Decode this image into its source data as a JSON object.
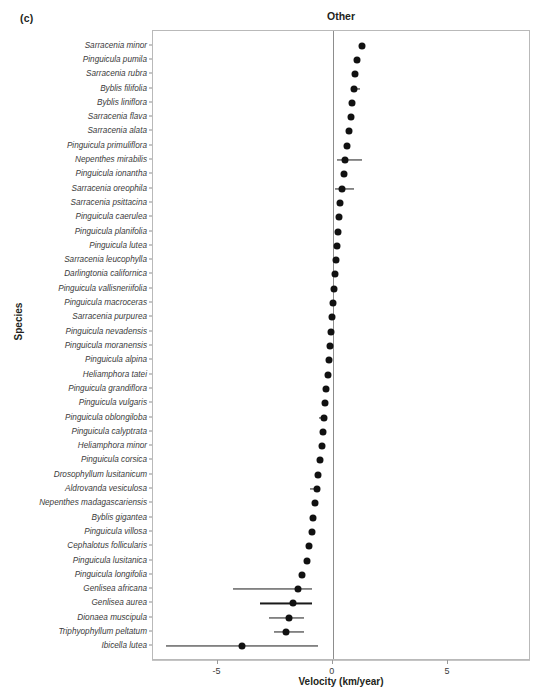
{
  "panel": {
    "label": "(c)"
  },
  "axes": {
    "title": "Other",
    "xlabel": "Velocity (km/year)",
    "ylabel": "Species",
    "xticks": [
      "-5",
      "0",
      "5"
    ]
  },
  "chart_data": {
    "type": "scatter",
    "title": "Other",
    "xlabel": "Velocity (km/year)",
    "ylabel": "Species",
    "xlim": [
      -7.8,
      8.6
    ],
    "xticks": [
      -5,
      0,
      5
    ],
    "grid": false,
    "legend": null,
    "annotations": [
      "(c)"
    ],
    "reference_line_x": 0,
    "orientation": "horizontal",
    "error_bar_type": "confidence-interval",
    "categories": [
      "Sarracenia minor",
      "Pinguicula pumila",
      "Sarracenia rubra",
      "Byblis filifolia",
      "Byblis liniflora",
      "Sarracenia flava",
      "Sarracenia alata",
      "Pinguicula primuliflora",
      "Nepenthes mirabilis",
      "Pinguicula ionantha",
      "Sarracenia oreophila",
      "Sarracenia psittacina",
      "Pinguicula caerulea",
      "Pinguicula planifolia",
      "Pinguicula lutea",
      "Sarracenia leucophylla",
      "Darlingtonia californica",
      "Pinguicula vallisneriifolia",
      "Pinguicula macroceras",
      "Sarracenia purpurea",
      "Pinguicula nevadensis",
      "Pinguicula moranensis",
      "Pinguicula alpina",
      "Heliamphora tatei",
      "Pinguicula grandiflora",
      "Pinguicula vulgaris",
      "Pinguicula oblongiloba",
      "Pinguicula calyptrata",
      "Heliamphora minor",
      "Pinguicula corsica",
      "Drosophyllum lusitanicum",
      "Aldrovanda vesiculosa",
      "Nepenthes madagascariensis",
      "Byblis gigantea",
      "Pinguicula villosa",
      "Cephalotus follicularis",
      "Pinguicula lusitanica",
      "Pinguicula longifolia",
      "Genlisea africana",
      "Genlisea aurea",
      "Dionaea muscipula",
      "Triphyophyllum peltatum",
      "Ibicella lutea"
    ],
    "values": [
      1.25,
      1.05,
      0.95,
      0.9,
      0.85,
      0.8,
      0.72,
      0.62,
      0.52,
      0.48,
      0.4,
      0.32,
      0.28,
      0.22,
      0.18,
      0.14,
      0.1,
      0.06,
      0.02,
      -0.04,
      -0.08,
      -0.12,
      -0.18,
      -0.22,
      -0.28,
      -0.32,
      -0.36,
      -0.42,
      -0.48,
      -0.54,
      -0.62,
      -0.68,
      -0.76,
      -0.84,
      -0.92,
      -1.02,
      -1.14,
      -1.34,
      -1.52,
      -1.72,
      -1.88,
      -2.04,
      -3.92
    ],
    "ci_low": [
      1.25,
      1.05,
      0.95,
      0.9,
      0.85,
      0.8,
      0.72,
      0.62,
      0.2,
      0.48,
      0.08,
      0.32,
      0.28,
      0.22,
      0.18,
      0.14,
      0.1,
      0.06,
      -0.14,
      -0.04,
      -0.08,
      -0.12,
      -0.18,
      -0.22,
      -0.28,
      -0.32,
      -0.6,
      -0.42,
      -0.48,
      -0.54,
      -0.62,
      -0.98,
      -0.76,
      -0.84,
      -0.92,
      -1.02,
      -1.14,
      -1.34,
      -4.32,
      -3.14,
      -2.76,
      -2.56,
      -7.22
    ],
    "ci_high": [
      1.25,
      1.05,
      0.95,
      1.16,
      0.85,
      0.8,
      0.72,
      0.62,
      1.26,
      0.48,
      0.92,
      0.32,
      0.28,
      0.22,
      0.18,
      0.14,
      0.1,
      0.12,
      0.02,
      -0.04,
      -0.08,
      -0.12,
      -0.18,
      -0.22,
      -0.28,
      -0.32,
      -0.36,
      -0.42,
      -0.48,
      -0.54,
      -0.62,
      -0.68,
      -0.76,
      -0.84,
      -0.92,
      -1.02,
      -1.14,
      -1.34,
      -0.92,
      -0.88,
      -1.26,
      -1.24,
      -0.66
    ]
  }
}
